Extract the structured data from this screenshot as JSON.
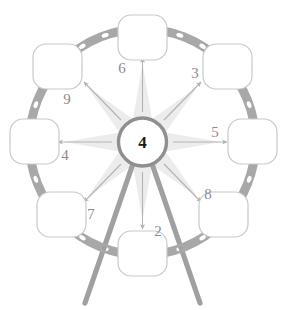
{
  "diagram": {
    "type": "radial-wheel",
    "center": {
      "label": "4",
      "shape": "circle",
      "fill": "#ffffff",
      "stroke": "#8f8f8f"
    },
    "ring": {
      "shape": "perforated-band",
      "color": "#a8a8a8",
      "hole_color": "#ffffff",
      "hole_count": 28
    },
    "starburst": {
      "points": 8,
      "color": "#ececec"
    },
    "nodes": [
      {
        "id": "node-top",
        "label": "",
        "angle_deg": 90,
        "shape": "rounded-square"
      },
      {
        "id": "node-top-right",
        "label": "",
        "angle_deg": 45,
        "shape": "rounded-square"
      },
      {
        "id": "node-right",
        "label": "",
        "angle_deg": 0,
        "shape": "rounded-square"
      },
      {
        "id": "node-bottom-right",
        "label": "",
        "angle_deg": -45,
        "shape": "rounded-square"
      },
      {
        "id": "node-bottom",
        "label": "",
        "angle_deg": -90,
        "shape": "rounded-square"
      },
      {
        "id": "node-bottom-left",
        "label": "",
        "angle_deg": -135,
        "shape": "rounded-square"
      },
      {
        "id": "node-left",
        "label": "",
        "angle_deg": 180,
        "shape": "rounded-square"
      },
      {
        "id": "node-top-left",
        "label": "",
        "angle_deg": 135,
        "shape": "rounded-square"
      }
    ],
    "spokes": [
      {
        "id": "spoke-6",
        "label": "6",
        "direction": "up",
        "arrow": true,
        "style": "thin"
      },
      {
        "id": "spoke-3",
        "label": "3",
        "direction": "up-right",
        "arrow": true,
        "style": "thin"
      },
      {
        "id": "spoke-5",
        "label": "5",
        "direction": "right",
        "arrow": true,
        "style": "thin"
      },
      {
        "id": "spoke-8",
        "label": "8",
        "direction": "down-right",
        "arrow": true,
        "style": "thin"
      },
      {
        "id": "spoke-2",
        "label": "2",
        "direction": "down",
        "arrow": true,
        "style": "thin"
      },
      {
        "id": "spoke-7",
        "label": "7",
        "direction": "down-left",
        "arrow": true,
        "style": "thin"
      },
      {
        "id": "spoke-4",
        "label": "4",
        "direction": "left",
        "arrow": true,
        "style": "thin"
      },
      {
        "id": "spoke-9",
        "label": "9",
        "direction": "up-left",
        "arrow": true,
        "style": "thin"
      }
    ],
    "thick_legs": [
      {
        "id": "leg-left",
        "color": "#a0a0a0",
        "from": "center",
        "to": "below-ring-left"
      },
      {
        "id": "leg-right",
        "color": "#a0a0a0",
        "from": "center",
        "to": "below-ring-right"
      }
    ],
    "labels": {
      "l2": "2",
      "l3": "3",
      "l4": "4",
      "l5": "5",
      "l6": "6",
      "l7": "7",
      "l8": "8",
      "l9": "9",
      "center": "4"
    }
  }
}
